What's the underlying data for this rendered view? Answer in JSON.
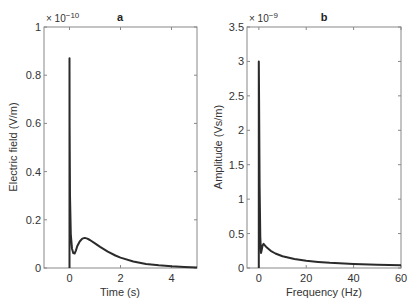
{
  "chart_data": [
    {
      "type": "line",
      "title": "a",
      "xlabel": "Time (s)",
      "ylabel": "Electric field (V/m)",
      "y_multiplier": "× 10^-10",
      "y_multiplier_base": "× 10",
      "y_multiplier_exp": "−10",
      "xlim": [
        -1,
        5
      ],
      "ylim": [
        0,
        1
      ],
      "xticks": [
        0,
        2,
        4
      ],
      "xtick_labels": [
        "0",
        "2",
        "4"
      ],
      "yticks": [
        0,
        0.2,
        0.4,
        0.6,
        0.8,
        1
      ],
      "ytick_labels": [
        "0",
        "0.2",
        "0.4",
        "0.6",
        "0.8",
        "1"
      ],
      "grid": false,
      "series": [
        {
          "name": "Electric field",
          "x": [
            0,
            0.005,
            0.02,
            0.05,
            0.1,
            0.15,
            0.2,
            0.25,
            0.3,
            0.4,
            0.5,
            0.6,
            0.7,
            0.8,
            1.0,
            1.2,
            1.5,
            1.8,
            2.0,
            2.5,
            3.0,
            3.5,
            4.0,
            4.5,
            5.0
          ],
          "y": [
            0.87,
            0.6,
            0.3,
            0.14,
            0.08,
            0.062,
            0.06,
            0.072,
            0.09,
            0.11,
            0.122,
            0.125,
            0.122,
            0.116,
            0.102,
            0.088,
            0.068,
            0.052,
            0.043,
            0.027,
            0.017,
            0.011,
            0.007,
            0.004,
            0.002
          ]
        }
      ]
    },
    {
      "type": "line",
      "title": "b",
      "xlabel": "Frequency (Hz)",
      "ylabel": "Amplitude (Vs/m)",
      "y_multiplier": "× 10^-9",
      "y_multiplier_base": "× 10",
      "y_multiplier_exp": "−9",
      "xlim": [
        -5,
        60
      ],
      "ylim": [
        0,
        3.5
      ],
      "xticks": [
        0,
        20,
        40,
        60
      ],
      "xtick_labels": [
        "0",
        "20",
        "40",
        "60"
      ],
      "yticks": [
        0,
        0.5,
        1,
        1.5,
        2,
        2.5,
        3,
        3.5
      ],
      "ytick_labels": [
        "0",
        "0.5",
        "1",
        "1.5",
        "2",
        "2.5",
        "3",
        "3.5"
      ],
      "grid": false,
      "series": [
        {
          "name": "Amplitude spectrum",
          "x": [
            0,
            0.1,
            0.3,
            0.6,
            0.9,
            1.2,
            1.6,
            2.0,
            2.5,
            3,
            4,
            5,
            7,
            10,
            15,
            20,
            25,
            30,
            40,
            50,
            60
          ],
          "y": [
            3.0,
            2.4,
            1.2,
            0.45,
            0.22,
            0.26,
            0.33,
            0.35,
            0.33,
            0.31,
            0.28,
            0.25,
            0.21,
            0.17,
            0.13,
            0.105,
            0.088,
            0.075,
            0.058,
            0.047,
            0.04
          ]
        }
      ]
    }
  ],
  "colors": {
    "line": "#2b2b2b",
    "axis": "#888888",
    "text": "#333333",
    "background": "#ffffff"
  }
}
